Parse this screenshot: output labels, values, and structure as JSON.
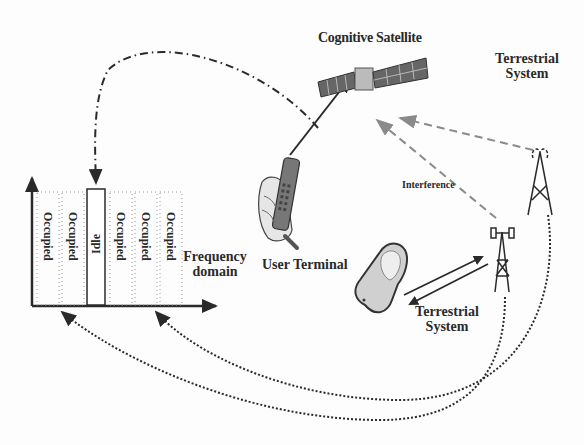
{
  "diagram": {
    "labels": {
      "satellite": "Cognitive Satellite",
      "terrestrial_system_top": "Terrestrial System",
      "interference": "Interference",
      "user_terminal": "User Terminal",
      "terrestrial_system_bottom": "Terrestrial System",
      "frequency_domain": "Frequency domain"
    },
    "spectrum": {
      "bands": [
        {
          "label": "Occupied",
          "state": "occupied"
        },
        {
          "label": "Occupied",
          "state": "occupied"
        },
        {
          "label": "Idle",
          "state": "idle"
        },
        {
          "label": "Occupied",
          "state": "occupied"
        },
        {
          "label": "Occupied",
          "state": "occupied"
        },
        {
          "label": "Occupied",
          "state": "occupied"
        }
      ]
    },
    "icons": [
      "satellite-icon",
      "handheld-terminal-icon",
      "cell-tower-icon",
      "mobile-phone-icon",
      "radio-mast-icon"
    ],
    "colors": {
      "line": "#2a2a2a",
      "interference_arrow": "#8a8a8a"
    }
  }
}
